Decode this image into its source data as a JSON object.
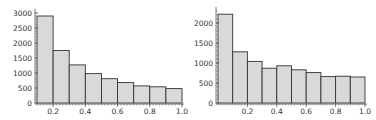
{
  "chart_data": [
    {
      "type": "bar",
      "title": "",
      "xlabel": "",
      "ylabel": "",
      "x_bin_edges": [
        0.1,
        0.2,
        0.3,
        0.4,
        0.5,
        0.6,
        0.7,
        0.8,
        0.9,
        1.0
      ],
      "values": [
        2900,
        1750,
        1270,
        980,
        810,
        680,
        570,
        540,
        480
      ],
      "xlim": [
        0.1,
        1.0
      ],
      "ylim": [
        0,
        3000
      ],
      "xticks": [
        "0.2",
        "0.4",
        "0.6",
        "0.8",
        "1.0"
      ],
      "xtick_values": [
        0.2,
        0.4,
        0.6,
        0.8,
        1.0
      ],
      "yticks": [
        "0",
        "500",
        "1000",
        "1500",
        "2000",
        "2500",
        "3000"
      ],
      "ytick_values": [
        0,
        500,
        1000,
        1500,
        2000,
        2500,
        3000
      ],
      "grid": false,
      "legend": null,
      "bar_color": "#d9d9d9",
      "edge_color": "#333333"
    },
    {
      "type": "bar",
      "title": "",
      "xlabel": "",
      "ylabel": "",
      "x_bin_edges": [
        0.0,
        0.1,
        0.2,
        0.3,
        0.4,
        0.5,
        0.6,
        0.7,
        0.8,
        0.9,
        1.0
      ],
      "values": [
        2220,
        1280,
        1040,
        870,
        930,
        830,
        760,
        660,
        670,
        650
      ],
      "xlim": [
        0.0,
        1.0
      ],
      "ylim": [
        0,
        2300
      ],
      "xticks": [
        "0.2",
        "0.4",
        "0.6",
        "0.8",
        "1.0"
      ],
      "xtick_values": [
        0.2,
        0.4,
        0.6,
        0.8,
        1.0
      ],
      "yticks": [
        "0",
        "500",
        "1000",
        "1500",
        "2000"
      ],
      "ytick_values": [
        0,
        500,
        1000,
        1500,
        2000
      ],
      "grid": false,
      "legend": null,
      "bar_color": "#d9d9d9",
      "edge_color": "#333333"
    }
  ]
}
